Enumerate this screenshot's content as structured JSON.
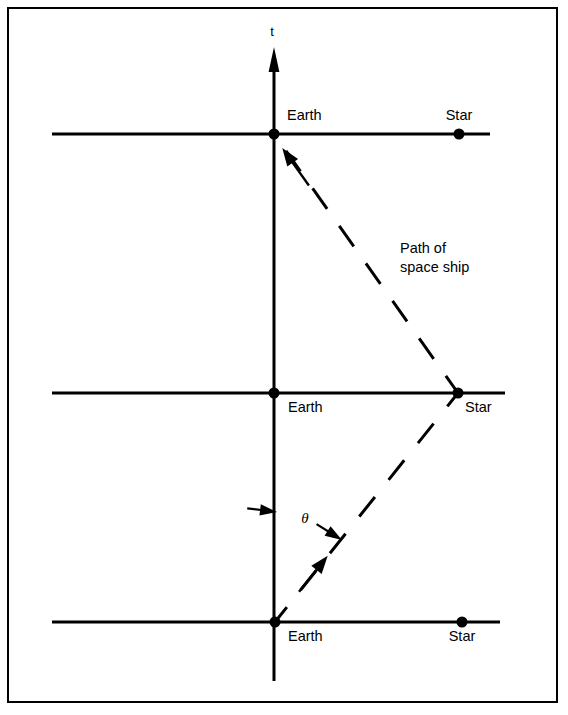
{
  "figure": {
    "type": "spacetime-diagram",
    "background_color": "#ffffff",
    "stroke_color": "#000000",
    "border": {
      "present": true,
      "x": 7,
      "y": 7,
      "width": 551,
      "height": 696,
      "stroke_width": 2
    },
    "time_axis": {
      "label": "t",
      "label_x": 272,
      "label_y": 36,
      "x": 274,
      "top_y": 48,
      "bottom_y": 681,
      "arrow_at_top": true,
      "stroke_width": 3
    },
    "events": [
      {
        "id": "top-frame",
        "axis_y": 134,
        "axis_x_start": 52,
        "axis_x_end": 490,
        "earth": {
          "label": "Earth",
          "x": 274,
          "label_x": 287,
          "label_y": 120,
          "label_anchor": "start"
        },
        "star": {
          "label": "Star",
          "x": 459,
          "label_x": 459,
          "label_y": 120,
          "label_anchor": "middle"
        }
      },
      {
        "id": "middle-frame",
        "axis_y": 393,
        "axis_x_start": 52,
        "axis_x_end": 505,
        "earth": {
          "label": "Earth",
          "x": 274,
          "label_x": 288,
          "label_y": 412,
          "label_anchor": "start"
        },
        "star": {
          "label": "Star",
          "x": 458,
          "label_x": 465,
          "label_y": 412,
          "label_anchor": "start"
        }
      },
      {
        "id": "bottom-frame",
        "axis_y": 622,
        "axis_x_start": 52,
        "axis_x_end": 500,
        "earth": {
          "label": "Earth",
          "x": 275,
          "label_x": 288,
          "label_y": 641,
          "label_anchor": "start"
        },
        "star": {
          "label": "Star",
          "x": 462,
          "label_x": 462,
          "label_y": 641,
          "label_anchor": "middle"
        }
      }
    ],
    "worldline": {
      "caption_line1": "Path of",
      "caption_line2": "space ship",
      "caption_x": 400,
      "caption_y1": 253,
      "caption_y2": 272,
      "dash_pattern": "24 20",
      "stroke_width": 3,
      "outbound_segment": {
        "description": "Earth (bottom) to Star (middle)",
        "x1": 275,
        "y1": 622,
        "x2": 458,
        "y2": 393,
        "arrow": {
          "x": 314,
          "y": 573,
          "direction": "up-right"
        }
      },
      "return_segment": {
        "description": "Star (middle) to Earth (top)",
        "x1": 458,
        "y1": 393,
        "x2": 274,
        "y2": 134,
        "arrow": {
          "x": 295,
          "y": 166,
          "direction": "up-left"
        }
      }
    },
    "angle_annotation": {
      "symbol": "θ",
      "label_x": 305,
      "label_y": 523,
      "left_arrow": {
        "tail_x": 306,
        "tail_y": 516,
        "tip_x": 277,
        "tip_y": 512
      },
      "right_arrow": {
        "tail_x": 317,
        "tail_y": 524,
        "tip_x": 342,
        "tip_y": 540
      }
    }
  }
}
